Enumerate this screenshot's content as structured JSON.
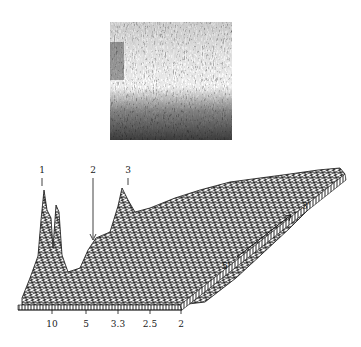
{
  "figure": {
    "top_panel": {
      "type": "grayscale-image",
      "description": "dense textured grayscale matrix, dark band at bottom"
    },
    "surface_plot": {
      "type": "3d-wireframe",
      "peak_labels": [
        "1",
        "2",
        "3"
      ],
      "x_axis": {
        "ticks": [
          "10",
          "5",
          "3.3",
          "2.5",
          "2"
        ]
      },
      "depth_axis": {
        "start_label": "5'",
        "end_label": "3'"
      }
    }
  }
}
